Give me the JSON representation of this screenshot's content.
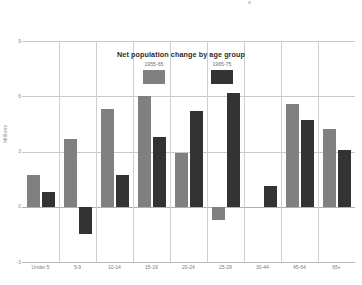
{
  "chart_data": {
    "type": "bar",
    "title": "Net population change by age group",
    "xlabel": "",
    "ylabel": "Millions",
    "categories": [
      "Under 5",
      "5-9",
      "10-14",
      "15-19",
      "20-24",
      "25-29",
      "30-44",
      "45-64",
      "65+"
    ],
    "series": [
      {
        "name": "1955-65",
        "color": "#808080",
        "values": [
          1.7,
          3.7,
          5.3,
          6.0,
          2.9,
          -0.7,
          0.0,
          5.6,
          4.2
        ]
      },
      {
        "name": "1965-75",
        "color": "#333333",
        "values": [
          0.8,
          -1.5,
          1.7,
          3.8,
          5.2,
          6.2,
          1.1,
          4.7,
          3.1
        ]
      }
    ],
    "ylim": [
      -3,
      9
    ],
    "yticks": [
      9,
      6,
      3,
      0,
      -3
    ],
    "ytick_labels": [
      "9",
      "6",
      "3",
      "0",
      "-3"
    ],
    "grid": true,
    "legend_position": "inside-top-center"
  },
  "axis": {
    "y_title": "Millions"
  }
}
